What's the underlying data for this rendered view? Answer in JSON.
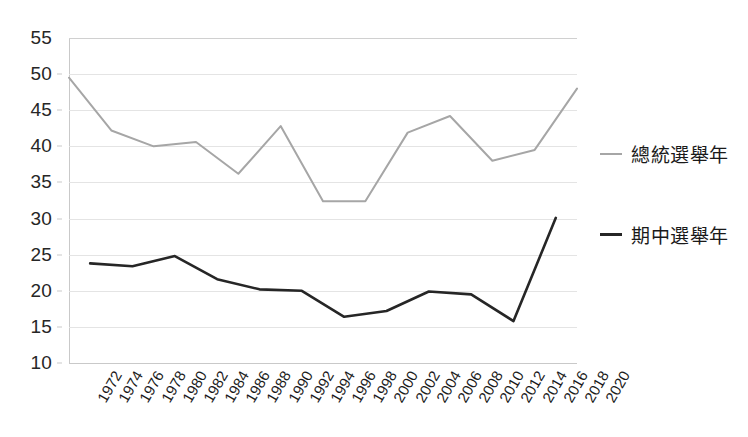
{
  "chart_data": {
    "type": "line",
    "title": "",
    "xlabel": "",
    "ylabel": "",
    "ylim": [
      10,
      55
    ],
    "y_ticks": [
      10,
      15,
      20,
      25,
      30,
      35,
      40,
      45,
      50,
      55
    ],
    "grid": true,
    "legend_position": "right",
    "x": [
      1972,
      1974,
      1976,
      1978,
      1980,
      1982,
      1984,
      1986,
      1988,
      1990,
      1992,
      1994,
      1996,
      1998,
      2000,
      2002,
      2004,
      2006,
      2008,
      2010,
      2012,
      2014,
      2016,
      2018,
      2020
    ],
    "x_tick_labels": [
      "1972",
      "1974",
      "1976",
      "1978",
      "1980",
      "1982",
      "1984",
      "1986",
      "1988",
      "1990",
      "1992",
      "1994",
      "1996",
      "1998",
      "2000",
      "2002",
      "2004",
      "2006",
      "2008",
      "2010",
      "2012",
      "2014",
      "2016",
      "2018",
      "2020"
    ],
    "series": [
      {
        "name": "總統選舉年",
        "color": "#a6a6a6",
        "x": [
          1972,
          1976,
          1980,
          1984,
          1988,
          1992,
          1996,
          2000,
          2004,
          2008,
          2012,
          2016,
          2020
        ],
        "values": [
          49.5,
          42.2,
          40.0,
          40.6,
          36.2,
          42.8,
          32.4,
          32.4,
          41.9,
          44.2,
          38.0,
          39.5,
          48.0
        ]
      },
      {
        "name": "期中選舉年",
        "color": "#262626",
        "x": [
          1974,
          1978,
          1982,
          1986,
          1990,
          1994,
          1998,
          2002,
          2006,
          2010,
          2014,
          2018
        ],
        "values": [
          23.8,
          23.4,
          24.8,
          21.6,
          20.2,
          20.0,
          16.4,
          17.2,
          19.9,
          19.5,
          15.8,
          30.1
        ]
      }
    ]
  },
  "legend": {
    "items": [
      {
        "label": "總統選舉年",
        "color": "#a6a6a6",
        "stroke": 2
      },
      {
        "label": "期中選舉年",
        "color": "#262626",
        "stroke": 3
      }
    ]
  }
}
